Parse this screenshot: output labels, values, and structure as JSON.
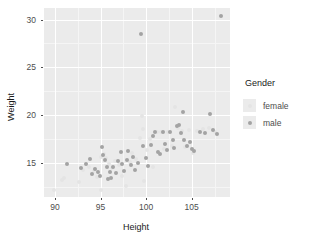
{
  "chart_data": {
    "type": "scatter",
    "title": "",
    "xlabel": "Height",
    "ylabel": "Weight",
    "xlim": [
      88.8,
      109.2
    ],
    "ylim": [
      11.4,
      31.2
    ],
    "xticks": [
      90,
      95,
      100,
      105
    ],
    "yticks": [
      15,
      20,
      25,
      30
    ],
    "xtick_labels": [
      "90",
      "95",
      "100",
      "105"
    ],
    "ytick_labels": [
      "15",
      "20",
      "25",
      "30"
    ],
    "x_minor_ticks": [
      92.5,
      97.5,
      102.5,
      107.5
    ],
    "y_minor_ticks": [
      12.5,
      17.5,
      22.5,
      27.5
    ],
    "grid": true,
    "legend": {
      "title": "Gender",
      "position": "right",
      "entries": [
        {
          "name": "female",
          "color": "#e4e4e4"
        },
        {
          "name": "male",
          "color": "#a3a3a3"
        }
      ]
    },
    "panel_background": "#ebebeb",
    "point_size": 4,
    "series": [
      {
        "name": "female",
        "color": "#e4e4e4",
        "points": [
          [
            89.9,
            12.1
          ],
          [
            90.8,
            13.2
          ],
          [
            91.0,
            13.4
          ],
          [
            92.6,
            13.0
          ],
          [
            93.1,
            14.2
          ],
          [
            93.7,
            14.6
          ],
          [
            94.3,
            14.1
          ],
          [
            94.6,
            13.5
          ],
          [
            95.0,
            12.1
          ],
          [
            95.1,
            15.6
          ],
          [
            95.4,
            15.9
          ],
          [
            95.6,
            15.5
          ],
          [
            95.9,
            14.9
          ],
          [
            96.2,
            14.4
          ],
          [
            96.6,
            15.2
          ],
          [
            97.0,
            14.8
          ],
          [
            97.4,
            13.6
          ],
          [
            97.8,
            12.6
          ],
          [
            98.2,
            15.1
          ],
          [
            98.5,
            16.0
          ],
          [
            98.9,
            15.4
          ],
          [
            99.3,
            17.6
          ],
          [
            99.5,
            19.9
          ],
          [
            99.6,
            18.5
          ],
          [
            99.8,
            13.1
          ],
          [
            100.1,
            16.3
          ],
          [
            100.4,
            17.5
          ],
          [
            100.8,
            14.6
          ],
          [
            101.2,
            18.2
          ],
          [
            101.6,
            18.2
          ],
          [
            102.0,
            16.4
          ],
          [
            102.4,
            18.2
          ],
          [
            102.8,
            16.8
          ],
          [
            103.2,
            20.8
          ],
          [
            103.5,
            18.6
          ],
          [
            103.9,
            18.3
          ],
          [
            104.3,
            16.6
          ],
          [
            104.7,
            18.4
          ],
          [
            105.1,
            16.0
          ],
          [
            105.6,
            18.3
          ],
          [
            106.2,
            18.5
          ],
          [
            106.9,
            18.6
          ],
          [
            107.6,
            18.2
          ]
        ]
      },
      {
        "name": "male",
        "color": "#a3a3a3",
        "points": [
          [
            91.3,
            14.9
          ],
          [
            92.9,
            14.4
          ],
          [
            93.4,
            14.9
          ],
          [
            93.8,
            15.4
          ],
          [
            94.1,
            13.8
          ],
          [
            94.4,
            14.3
          ],
          [
            94.7,
            14.0
          ],
          [
            94.9,
            13.6
          ],
          [
            95.2,
            16.6
          ],
          [
            95.3,
            15.8
          ],
          [
            95.5,
            15.3
          ],
          [
            95.7,
            14.6
          ],
          [
            95.8,
            13.3
          ],
          [
            96.0,
            14.0
          ],
          [
            96.1,
            13.4
          ],
          [
            96.4,
            14.5
          ],
          [
            96.7,
            13.9
          ],
          [
            96.9,
            15.2
          ],
          [
            97.2,
            16.1
          ],
          [
            97.3,
            14.9
          ],
          [
            97.6,
            14.1
          ],
          [
            97.9,
            15.3
          ],
          [
            98.0,
            16.2
          ],
          [
            98.3,
            14.8
          ],
          [
            98.6,
            15.6
          ],
          [
            98.8,
            14.2
          ],
          [
            99.1,
            15.0
          ],
          [
            99.4,
            28.5
          ],
          [
            99.7,
            16.7
          ],
          [
            100.0,
            15.5
          ],
          [
            100.2,
            14.7
          ],
          [
            100.5,
            16.9
          ],
          [
            100.7,
            17.8
          ],
          [
            101.0,
            18.2
          ],
          [
            101.3,
            16.1
          ],
          [
            101.5,
            15.9
          ],
          [
            101.8,
            18.2
          ],
          [
            102.1,
            17.0
          ],
          [
            102.3,
            16.3
          ],
          [
            102.6,
            18.2
          ],
          [
            102.9,
            17.4
          ],
          [
            103.1,
            16.5
          ],
          [
            103.4,
            18.8
          ],
          [
            103.6,
            19.0
          ],
          [
            103.8,
            18.1
          ],
          [
            104.0,
            20.3
          ],
          [
            104.2,
            17.4
          ],
          [
            104.5,
            16.8
          ],
          [
            104.8,
            17.2
          ],
          [
            105.0,
            16.4
          ],
          [
            105.3,
            16.2
          ],
          [
            105.9,
            18.2
          ],
          [
            106.5,
            18.1
          ],
          [
            107.0,
            20.1
          ],
          [
            107.3,
            18.4
          ],
          [
            107.8,
            18.0
          ],
          [
            108.2,
            30.4
          ]
        ]
      }
    ]
  }
}
